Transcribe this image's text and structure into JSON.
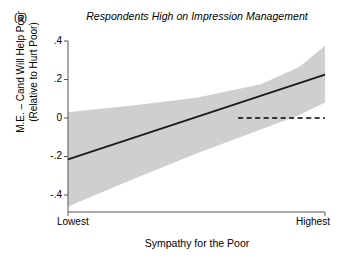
{
  "panel": {
    "label": "(a)"
  },
  "chart_data": {
    "type": "line",
    "title": "Respondents High on Impression Management",
    "xlabel": "Sympathy for the Poor",
    "ylabel": "M.E. – Cand Will Help Poor\n(Relative to Hurt Poor)",
    "ylabel_line1": "M.E. – Cand Will Help Poor",
    "ylabel_line2": "(Relative to Hurt Poor)",
    "xtick_labels": [
      "Lowest",
      "Highest"
    ],
    "ytick_labels": [
      ".4",
      ".2",
      "0",
      "-.2",
      "-.4"
    ],
    "ytick_values": [
      0.4,
      0.2,
      0,
      -0.2,
      -0.4
    ],
    "ylim": [
      -0.5,
      0.42
    ],
    "xlim": [
      0,
      1
    ],
    "grid": false,
    "legend": null,
    "series": [
      {
        "name": "Marginal effect (fit)",
        "type": "line",
        "style": "solid",
        "color": "#1a1a1a",
        "x": [
          0,
          1
        ],
        "values": [
          -0.215,
          0.225
        ]
      },
      {
        "name": "95% confidence interval",
        "type": "band",
        "color": "#cfcfcf",
        "x": [
          0,
          0.25,
          0.5,
          0.75,
          0.9,
          1
        ],
        "upper": [
          0.03,
          0.065,
          0.105,
          0.175,
          0.265,
          0.375
        ],
        "lower": [
          -0.46,
          -0.32,
          -0.185,
          -0.06,
          0.015,
          0.08
        ]
      },
      {
        "name": "Zero reference line",
        "type": "hline",
        "style": "dashed",
        "color": "#000000",
        "value": 0,
        "x_start": 0.662,
        "x_end": 1
      }
    ]
  }
}
